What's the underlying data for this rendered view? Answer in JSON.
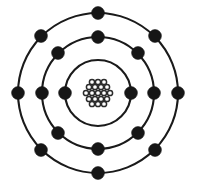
{
  "figure": {
    "background_color": "#ffffff",
    "stroke_color": "#1a1a1a",
    "electron_color": "#161616",
    "nucleus_outline_color": "#2b2b2b",
    "nucleus_fill_color": "#ffffff",
    "width": 197,
    "height": 185,
    "center_x": 98,
    "center_y": 93
  },
  "chart_data": {
    "type": "scatter",
    "xlabel": "",
    "ylabel": "",
    "subtitle": "",
    "legend": [],
    "grid": false,
    "xlim": [
      0,
      197
    ],
    "ylim": [
      0,
      185
    ],
    "nucleus": {
      "label": "nucleus",
      "center": [
        98,
        93
      ],
      "nucleon_radius": 2.6,
      "nucleon_count": 19,
      "nucleons": [
        [
          92,
          82
        ],
        [
          98,
          82
        ],
        [
          104,
          82
        ],
        [
          89,
          87
        ],
        [
          95,
          87
        ],
        [
          101,
          87
        ],
        [
          107,
          87
        ],
        [
          86,
          93
        ],
        [
          92,
          93
        ],
        [
          98,
          93
        ],
        [
          104,
          93
        ],
        [
          110,
          93
        ],
        [
          89,
          99
        ],
        [
          95,
          99
        ],
        [
          101,
          99
        ],
        [
          107,
          99
        ],
        [
          92,
          104
        ],
        [
          98,
          104
        ],
        [
          104,
          104
        ]
      ]
    },
    "shells": [
      {
        "name": "shell-1",
        "label": "K shell",
        "radius": 33,
        "electron_count": 2,
        "electron_angles_deg": [
          180,
          0
        ],
        "electrons": [
          [
            65,
            93
          ],
          [
            131,
            93
          ]
        ]
      },
      {
        "name": "shell-2",
        "label": "L shell",
        "radius": 56,
        "electron_count": 8,
        "electron_angles_deg": [
          180,
          135,
          90,
          45,
          0,
          315,
          270,
          225
        ],
        "electrons": [
          [
            42,
            93
          ],
          [
            58,
            53
          ],
          [
            98,
            37
          ],
          [
            138,
            53
          ],
          [
            154,
            93
          ],
          [
            138,
            133
          ],
          [
            98,
            149
          ],
          [
            58,
            133
          ]
        ]
      },
      {
        "name": "shell-3",
        "label": "M shell",
        "radius": 80,
        "electron_count": 8,
        "electron_angles_deg": [
          180,
          135,
          90,
          45,
          0,
          315,
          270,
          225
        ],
        "electrons": [
          [
            18,
            93
          ],
          [
            41,
            36
          ],
          [
            98,
            13
          ],
          [
            155,
            36
          ],
          [
            178,
            93
          ],
          [
            155,
            150
          ],
          [
            98,
            173
          ],
          [
            41,
            150
          ]
        ]
      }
    ],
    "electron_radius": 6.4,
    "total_electrons": 18,
    "ring_stroke_width": 2.1
  }
}
